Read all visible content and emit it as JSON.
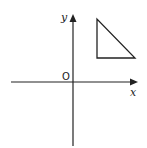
{
  "diagram": {
    "type": "coordinate-plane",
    "axes": {
      "x_label": "x",
      "y_label": "y",
      "origin_label": "O"
    },
    "shapes": [
      {
        "type": "right-triangle",
        "quadrant": "I",
        "vertices": [
          "top-left",
          "bottom-left",
          "bottom-right"
        ],
        "right_angle_at": "bottom-left"
      }
    ],
    "colors": {
      "line": "#222222",
      "background": "#ffffff"
    }
  }
}
